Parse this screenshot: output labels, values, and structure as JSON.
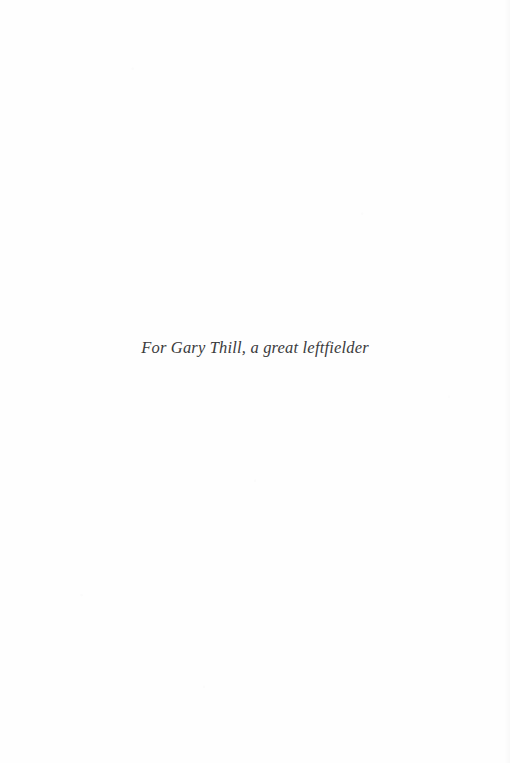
{
  "page": {
    "kind": "book-dedication-page",
    "background_color": "#fefefe",
    "width": 510,
    "height": 763
  },
  "dedication": {
    "text": "For Gary Thill, a great leftfielder",
    "style": "italic",
    "alignment": "center",
    "text_color": "#3b3b3d"
  }
}
